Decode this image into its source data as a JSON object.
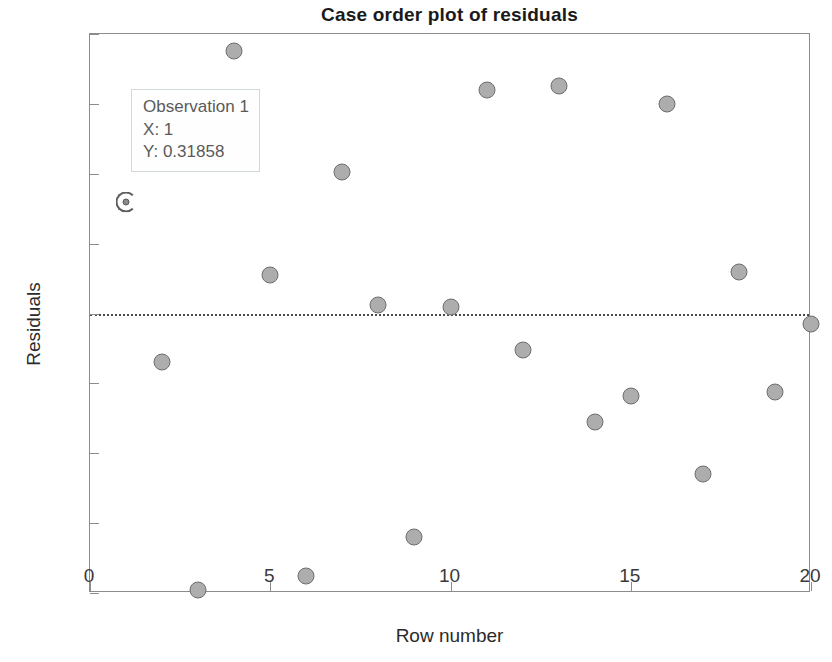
{
  "chart_data": {
    "type": "scatter",
    "title": "Case order plot of residuals",
    "xlabel": "Row number",
    "ylabel": "Residuals",
    "xlim": [
      0,
      20
    ],
    "ylim": [
      -0.8,
      0.8
    ],
    "xticks": [
      "0",
      "5",
      "10",
      "15",
      "20"
    ],
    "xtick_values": [
      0,
      5,
      10,
      15,
      20
    ],
    "yticks": [
      "0.8",
      "0.6",
      "0.4",
      "0.2",
      "0",
      "-0.2",
      "-0.4",
      "-0.6",
      "-0.8"
    ],
    "ytick_values": [
      0.8,
      0.6,
      0.4,
      0.2,
      0,
      -0.2,
      -0.4,
      -0.6,
      -0.8
    ],
    "grid": false,
    "legend": null,
    "reference_line": {
      "type": "horizontal-dotted",
      "value": 0
    },
    "marker": {
      "fill": "#adadad",
      "edge": "#6e6e6e",
      "shape": "circle"
    },
    "x": [
      1,
      2,
      3,
      4,
      5,
      6,
      7,
      8,
      9,
      10,
      11,
      12,
      13,
      14,
      15,
      16,
      17,
      18,
      19,
      20
    ],
    "values": [
      0.31858,
      -0.14,
      -0.79,
      0.75,
      0.11,
      -0.75,
      0.405,
      0.025,
      -0.64,
      0.02,
      0.64,
      -0.105,
      0.65,
      -0.31,
      -0.235,
      0.6,
      -0.46,
      0.12,
      -0.225,
      -0.03
    ],
    "selected_index": 1,
    "annotation": {
      "line1": "Observation 1",
      "line2": "X: 1",
      "line3": "Y: 0.31858"
    }
  }
}
